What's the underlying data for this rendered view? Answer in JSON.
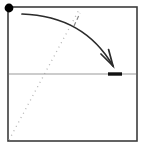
{
  "figure": {
    "width": 147,
    "height": 148,
    "background_color": "#ffffff"
  },
  "colors": {
    "frame": "#3c3c3c",
    "pivot_dot": "#000000",
    "arc_arrow": "#2b2b2b",
    "axis_line": "#9a9a9a",
    "thick_segment": "#111111",
    "dotted_line": "#b4b4b4",
    "short_dash": "#888888"
  },
  "elements": {
    "frame": {
      "name": "square-frame",
      "x": 8,
      "y": 7,
      "width": 129,
      "height": 134,
      "stroke_width": 1.6
    },
    "pivot_dot": {
      "name": "pivot-dot",
      "cx": 9,
      "cy": 8,
      "r": 4.4
    },
    "arc_arrow": {
      "name": "curved-arrow",
      "start_x": 22,
      "start_y": 14,
      "control_x": 84,
      "control_y": 16,
      "end_x": 113,
      "end_y": 66,
      "stroke_width": 1.7,
      "arrowhead_length": 17,
      "arrowhead_spread": 15
    },
    "axis_line": {
      "name": "horizontal-axis-line",
      "x1": 9,
      "y1": 74,
      "x2": 136,
      "y2": 74,
      "stroke_width": 1.2
    },
    "thick_segment": {
      "name": "thick-bar-segment",
      "x1": 108,
      "y1": 74,
      "x2": 122,
      "y2": 74,
      "stroke_width": 3.4
    },
    "dotted_line": {
      "name": "dotted-diagonal-line",
      "x1": 9,
      "y1": 140,
      "x2": 80,
      "y2": 8,
      "stroke_width": 1.3,
      "dash_pattern": "1 4"
    },
    "short_dash": {
      "name": "short-dash-tick",
      "x1": 74,
      "y1": 26,
      "x2": 80,
      "y2": 13,
      "stroke_width": 1.2,
      "dash_pattern": "4 3"
    }
  }
}
